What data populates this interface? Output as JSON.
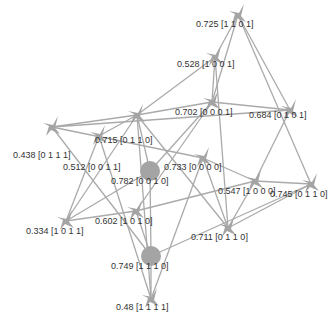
{
  "diagram": {
    "type": "network-graph",
    "colors": {
      "edge": "#aaaaaa",
      "node": "#a4a4a4",
      "label": "#333333",
      "background": "#ffffff"
    },
    "nodes": [
      {
        "id": "n0",
        "label": "0.725 [1 1 0 1]",
        "shape": "arrow",
        "x": 238,
        "y": 15,
        "lx": 196,
        "ly": 27
      },
      {
        "id": "n1",
        "label": "0.528 [1 0 0 1]",
        "shape": "arrow",
        "x": 215,
        "y": 57,
        "lx": 177,
        "ly": 67
      },
      {
        "id": "n2",
        "label": "0.702 [0 0 0 1]",
        "shape": "arrow",
        "x": 212,
        "y": 102,
        "lx": 175,
        "ly": 115
      },
      {
        "id": "n3",
        "label": "0.684 [0 1 0 1]",
        "shape": "arrow",
        "x": 290,
        "y": 110,
        "lx": 249,
        "ly": 118
      },
      {
        "id": "n4",
        "label": "0.715 [0 1 1 0]",
        "shape": "arrow",
        "x": 137,
        "y": 115,
        "lx": 95,
        "ly": 143
      },
      {
        "id": "n5",
        "label": "0.438 [0 1 1 1]",
        "shape": "arrow",
        "x": 52,
        "y": 127,
        "lx": 13,
        "ly": 158
      },
      {
        "id": "n6",
        "label": "0.512 [0 0 1 1]",
        "shape": "arrow",
        "x": 99,
        "y": 136,
        "lx": 63,
        "ly": 170
      },
      {
        "id": "n7",
        "label": "0.782 [0 0 1 0]",
        "shape": "circle",
        "x": 150,
        "y": 171,
        "lx": 111,
        "ly": 184
      },
      {
        "id": "n8",
        "label": "0.733 [0 0 0 0]",
        "shape": "arrow",
        "x": 203,
        "y": 158,
        "lx": 164,
        "ly": 170
      },
      {
        "id": "n9",
        "label": "0.547 [1 0 0 0]",
        "shape": "arrow",
        "x": 255,
        "y": 181,
        "lx": 218,
        "ly": 194
      },
      {
        "id": "n10",
        "label": "0.745 [0 1 1 0]",
        "shape": "arrow",
        "x": 311,
        "y": 184,
        "lx": 270,
        "ly": 197
      },
      {
        "id": "n11",
        "label": "0.334 [1 0 1 1]",
        "shape": "arrow",
        "x": 66,
        "y": 221,
        "lx": 26,
        "ly": 234
      },
      {
        "id": "n12",
        "label": "0.602 [1 0 1 0]",
        "shape": "arrow",
        "x": 136,
        "y": 211,
        "lx": 95,
        "ly": 224
      },
      {
        "id": "n13",
        "label": "0.711 [0 1 1 0]",
        "shape": "arrow",
        "x": 228,
        "y": 228,
        "lx": 191,
        "ly": 240
      },
      {
        "id": "n14",
        "label": "0.749 [1 1 1 0]",
        "shape": "circle",
        "x": 151,
        "y": 256,
        "lx": 111,
        "ly": 269
      },
      {
        "id": "n15",
        "label": "0.48 [1 1 1 1]",
        "shape": "arrow",
        "x": 151,
        "y": 299,
        "lx": 116,
        "ly": 310
      }
    ],
    "edges": [
      [
        "n0",
        "n1"
      ],
      [
        "n0",
        "n2"
      ],
      [
        "n0",
        "n3"
      ],
      [
        "n0",
        "n10"
      ],
      [
        "n1",
        "n2"
      ],
      [
        "n1",
        "n4"
      ],
      [
        "n1",
        "n13"
      ],
      [
        "n2",
        "n3"
      ],
      [
        "n2",
        "n4"
      ],
      [
        "n2",
        "n7"
      ],
      [
        "n2",
        "n12"
      ],
      [
        "n3",
        "n5"
      ],
      [
        "n3",
        "n9"
      ],
      [
        "n4",
        "n5"
      ],
      [
        "n4",
        "n6"
      ],
      [
        "n4",
        "n11"
      ],
      [
        "n4",
        "n7"
      ],
      [
        "n4",
        "n13"
      ],
      [
        "n4",
        "n15"
      ],
      [
        "n5",
        "n8"
      ],
      [
        "n5",
        "n14"
      ],
      [
        "n6",
        "n11"
      ],
      [
        "n6",
        "n15"
      ],
      [
        "n8",
        "n9"
      ],
      [
        "n8",
        "n13"
      ],
      [
        "n8",
        "n15"
      ],
      [
        "n9",
        "n10"
      ],
      [
        "n9",
        "n12"
      ],
      [
        "n9",
        "n13"
      ],
      [
        "n10",
        "n13"
      ],
      [
        "n10",
        "n14"
      ],
      [
        "n11",
        "n12"
      ],
      [
        "n11",
        "n7"
      ],
      [
        "n12",
        "n14"
      ],
      [
        "n7",
        "n14"
      ],
      [
        "n14",
        "n15"
      ]
    ]
  }
}
